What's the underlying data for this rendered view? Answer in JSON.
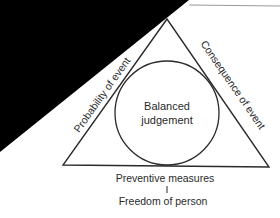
{
  "diagram": {
    "center_label_line1": "Balanced",
    "center_label_line2": "judgement",
    "left_side_label": "Probability of event",
    "right_side_label": "Consequence of event",
    "bottom_label": "Preventive measures",
    "bottom_sublabel": "Freedom of person"
  },
  "colors": {
    "line": "#2a2a2a",
    "mask": "#000000",
    "background": "#ffffff"
  }
}
